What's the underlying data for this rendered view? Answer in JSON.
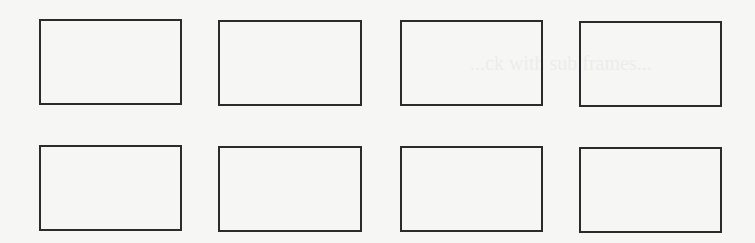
{
  "page": {
    "background": "#f6f6f5",
    "border_color": "#2b2b2b",
    "ghost_text": "...ck with sub frames..."
  },
  "grid": {
    "rows": 2,
    "columns": 4,
    "boxes": [
      {
        "row": 1,
        "col": 1,
        "x": 39,
        "y": 19,
        "w": 143,
        "h": 86
      },
      {
        "row": 1,
        "col": 2,
        "x": 218,
        "y": 20,
        "w": 144,
        "h": 86
      },
      {
        "row": 1,
        "col": 3,
        "x": 400,
        "y": 20,
        "w": 143,
        "h": 86
      },
      {
        "row": 1,
        "col": 4,
        "x": 579,
        "y": 21,
        "w": 143,
        "h": 86
      },
      {
        "row": 2,
        "col": 1,
        "x": 39,
        "y": 145,
        "w": 143,
        "h": 86
      },
      {
        "row": 2,
        "col": 2,
        "x": 218,
        "y": 146,
        "w": 144,
        "h": 86
      },
      {
        "row": 2,
        "col": 3,
        "x": 400,
        "y": 146,
        "w": 143,
        "h": 86
      },
      {
        "row": 2,
        "col": 4,
        "x": 579,
        "y": 147,
        "w": 143,
        "h": 86
      }
    ]
  }
}
